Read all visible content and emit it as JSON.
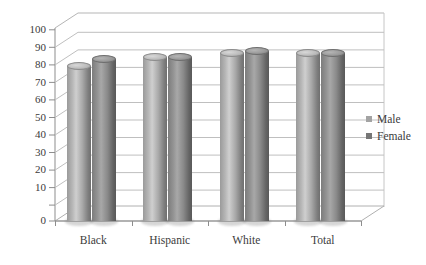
{
  "chart_data": {
    "type": "bar",
    "title": "",
    "subtitle": "",
    "xlabel": "",
    "ylabel": "",
    "ylim": [
      0,
      100
    ],
    "ytick_step": 10,
    "grid": true,
    "style": "3d-cylinder",
    "legend_position": "right",
    "categories": [
      "Black",
      "Hispanic",
      "White",
      "Total"
    ],
    "series": [
      {
        "name": "Male",
        "color": "#a9a9a9",
        "values": [
          83,
          88,
          90,
          90
        ]
      },
      {
        "name": "Female",
        "color": "#7a7a7a",
        "values": [
          87,
          88,
          91,
          90
        ]
      }
    ],
    "yticks": [
      "0",
      "10",
      "20",
      "30",
      "40",
      "50",
      "60",
      "70",
      "80",
      "90",
      "100"
    ]
  },
  "legend": {
    "items": [
      {
        "label": "Male",
        "swatch": "#a3a3a3"
      },
      {
        "label": "Female",
        "swatch": "#767676"
      }
    ]
  },
  "axis": {
    "y_labels": [
      "100",
      "90",
      "80",
      "70",
      "60",
      "50",
      "40",
      "30",
      "20",
      "10",
      "0"
    ],
    "x_labels": [
      "Black",
      "Hispanic",
      "White",
      "Total"
    ]
  }
}
